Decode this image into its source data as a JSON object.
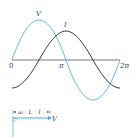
{
  "diagram": {
    "title": "",
    "waveform": {
      "axis_labels": {
        "zero": "0",
        "pi": "π",
        "two_pi": "2π"
      },
      "curves": [
        {
          "name": "V",
          "label": "V",
          "color": "#6ab4de"
        },
        {
          "name": "I",
          "label": "I",
          "color": "#2a3a4a"
        }
      ]
    },
    "phasor": {
      "vector_label": "V",
      "magnitude_label": "ω · L · I",
      "vector_color": "#4aa8dc",
      "axis_color": "#6ab4de"
    }
  }
}
